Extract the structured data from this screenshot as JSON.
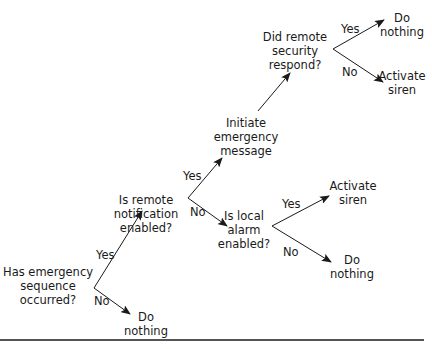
{
  "diagram": {
    "type": "decision-tree",
    "nodes": {
      "q1": "Has emergency\nsequence\noccurred?",
      "q1_no": "Do\nnothing",
      "q2": "Is remote\nnotification\nenabled?",
      "q2_yes": "Initiate\nemergency\nmessage",
      "q3": "Did remote\nsecurity\nrespond?",
      "q3_yes": "Do\nnothing",
      "q3_no": "Activate\nsiren",
      "q4": "Is local\nalarm\nenabled?",
      "q4_yes": "Activate\nsiren",
      "q4_no": "Do\nnothing"
    },
    "edge_labels": {
      "q1_yes": "Yes",
      "q1_no": "No",
      "q2_yes": "Yes",
      "q2_no": "No",
      "q3_yes": "Yes",
      "q3_no": "No",
      "q4_yes": "Yes",
      "q4_no": "No"
    },
    "colors": {
      "line": "#1a1a1a",
      "rule": "#555555"
    }
  }
}
